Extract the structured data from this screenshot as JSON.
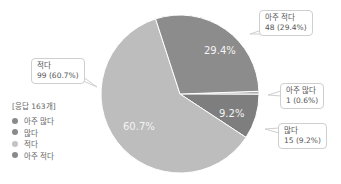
{
  "chart_data": {
    "type": "pie",
    "title": "",
    "total_label": "[응답 163개]",
    "categories": [
      "아주 많다",
      "많다",
      "적다",
      "아주 적다"
    ],
    "values": [
      1,
      15,
      99,
      48
    ],
    "percentages": [
      0.6,
      9.2,
      60.7,
      29.4
    ],
    "colors": [
      "#b0b0b0",
      "#7e7e7e",
      "#bdbdbd",
      "#8c8c8c"
    ],
    "slice_labels": [
      "",
      "9.2%",
      "60.7%",
      "29.4%"
    ],
    "callouts": [
      "아주 많다\n1 (0.6%)",
      "많다\n15 (9.2%)",
      "적다\n99 (60.7%)",
      "아주 적다\n48 (29.4%)"
    ],
    "legend_position": "left"
  },
  "legend": {
    "title": "[응답 163개]",
    "items": [
      {
        "label": "아주 많다",
        "color": "#8a8a8a"
      },
      {
        "label": "많다",
        "color": "#8a8a8a"
      },
      {
        "label": "적다",
        "color": "#c4c4c4"
      },
      {
        "label": "아주 적다",
        "color": "#8a8a8a"
      }
    ]
  },
  "callouts": {
    "very_few": {
      "line1": "아주 적다",
      "line2": "48 (29.4%)"
    },
    "very_many": {
      "line1": "아주 많다",
      "line2": "1 (0.6%)"
    },
    "many": {
      "line1": "많다",
      "line2": "15 (9.2%)"
    },
    "few": {
      "line1": "적다",
      "line2": "99 (60.7%)"
    }
  },
  "slice_labels": {
    "very_few": "29.4%",
    "many": "9.2%",
    "few": "60.7%"
  }
}
